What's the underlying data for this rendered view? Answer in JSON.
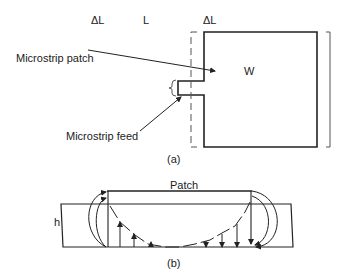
{
  "figure_a": {
    "dimension_labels": {
      "delta_l_left": "ΔL",
      "length": "L",
      "delta_l_right": "ΔL"
    },
    "width_label": "W",
    "patch_callout": "Microstrip patch",
    "feed_callout": "Microstrip feed",
    "caption": "(a)"
  },
  "figure_b": {
    "patch_label": "Patch",
    "height_label": "h",
    "caption": "(b)"
  }
}
